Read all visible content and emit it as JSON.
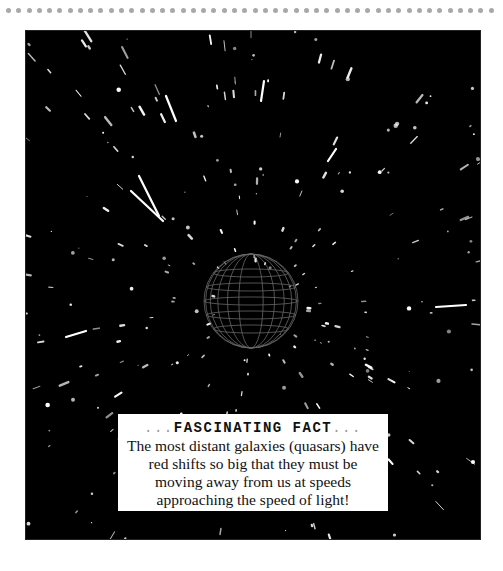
{
  "page": {
    "decorative_rule": {
      "dot_count": 48,
      "dot_color": "#a8a8a8"
    },
    "image": {
      "description": "Starfield with radial streaks of light rushing outward from a faint spherical wireframe object in the center",
      "background_color": "#000000",
      "star_color": "#ffffff"
    },
    "fact_box": {
      "title_prefix": "...",
      "title": "FASCINATING FACT",
      "title_suffix": "...",
      "body": "The most distant galaxies (quasars) have red shifts so big that they must be moving away from us at speeds approaching the speed of light!"
    }
  }
}
